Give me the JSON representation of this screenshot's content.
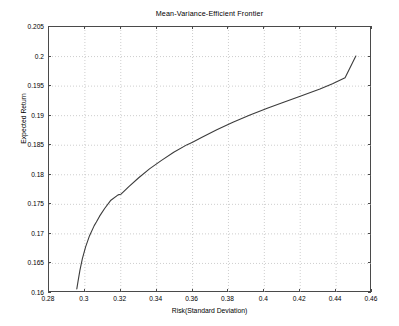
{
  "chart_data": {
    "type": "line",
    "title": "Mean-Variance-Efficient Frontier",
    "xlabel": "Risk(Standard Deviation)",
    "ylabel": "Expected Return",
    "xlim": [
      0.28,
      0.46
    ],
    "ylim": [
      0.16,
      0.205
    ],
    "grid": true,
    "grid_style": "dotted",
    "legend": "none",
    "line_color": "#3c3c3c",
    "xticks": [
      0.28,
      0.3,
      0.32,
      0.34,
      0.36,
      0.38,
      0.4,
      0.42,
      0.44,
      0.46
    ],
    "xtick_labels": [
      "0.28",
      "0.3",
      "0.32",
      "0.34",
      "0.36",
      "0.38",
      "0.4",
      "0.42",
      "0.44",
      "0.46"
    ],
    "yticks": [
      0.16,
      0.165,
      0.17,
      0.175,
      0.18,
      0.185,
      0.19,
      0.195,
      0.2,
      0.205
    ],
    "ytick_labels": [
      "0.16",
      "0.165",
      "0.17",
      "0.175",
      "0.18",
      "0.185",
      "0.19",
      "0.195",
      "0.2",
      "0.205"
    ],
    "series": [
      {
        "name": "Efficient Frontier",
        "x": [
          0.2955,
          0.2962,
          0.2972,
          0.2986,
          0.3004,
          0.3026,
          0.3052,
          0.3064,
          0.3082,
          0.311,
          0.3145,
          0.3185,
          0.32,
          0.3245,
          0.33,
          0.336,
          0.3425,
          0.3495,
          0.357,
          0.36,
          0.365,
          0.3735,
          0.3825,
          0.392,
          0.402,
          0.41,
          0.42,
          0.431,
          0.438,
          0.445,
          0.451
        ],
        "y": [
          0.1607,
          0.162,
          0.1638,
          0.1658,
          0.1678,
          0.1697,
          0.1714,
          0.172,
          0.173,
          0.1743,
          0.1757,
          0.1766,
          0.1767,
          0.178,
          0.1795,
          0.181,
          0.1824,
          0.1838,
          0.1851,
          0.1855,
          0.1863,
          0.1876,
          0.1889,
          0.1901,
          0.1913,
          0.1922,
          0.1933,
          0.1945,
          0.1954,
          0.1964,
          0.2001
        ]
      }
    ]
  }
}
